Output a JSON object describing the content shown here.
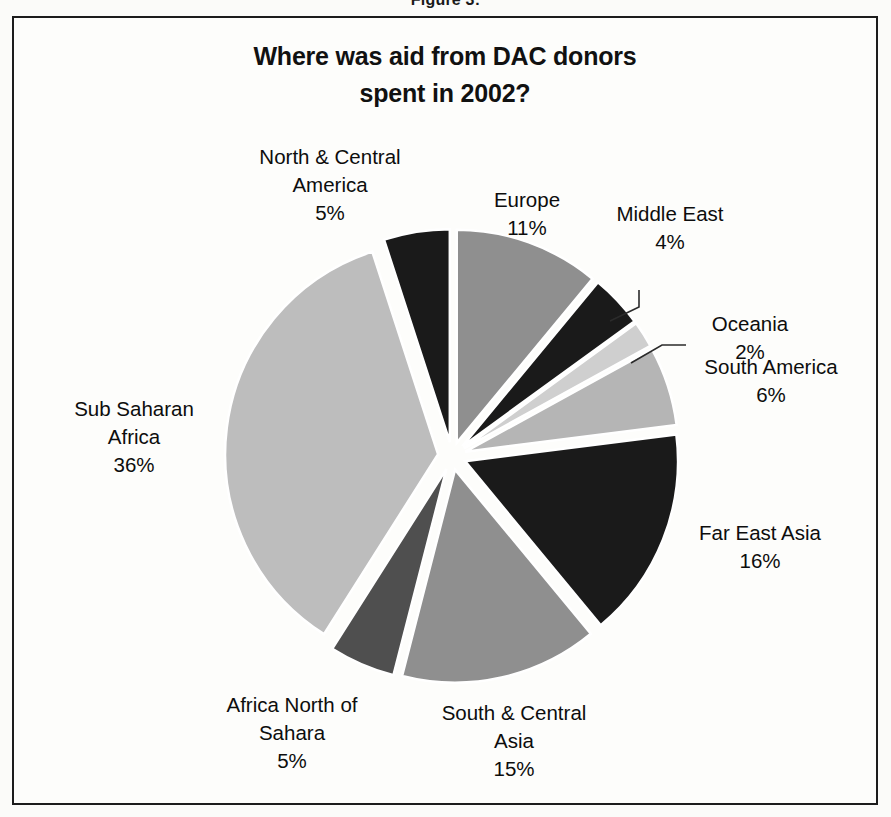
{
  "figure": {
    "caption": "Figure 3:"
  },
  "chart_title": {
    "line1": "Where was aid from DAC donors",
    "line2": "spent in 2002?"
  },
  "colors": {
    "background": "#fdfdfb",
    "frame_border": "#1c1c1c",
    "text": "#0d0d0d",
    "slice_black": "#1a1a1a",
    "slice_dark_gray": "#4f4f4f",
    "slice_mid_gray": "#8f8f8f",
    "slice_gray": "#9a9a9a",
    "slice_light_gray": "#bdbdbd",
    "slice_pale_gray": "#cfcfcf",
    "leader_line": "#2b2b2b"
  },
  "chart_data": {
    "type": "pie",
    "title": "Where was aid from DAC donors spent in 2002?",
    "unit": "%",
    "exploded": true,
    "legend_position": "none",
    "labels_show_percent": true,
    "categories": [
      "Europe",
      "Middle East",
      "Oceania",
      "South America",
      "Far East Asia",
      "South & Central Asia",
      "Africa North of Sahara",
      "Sub Saharan Africa",
      "North & Central America"
    ],
    "values": [
      11,
      4,
      2,
      6,
      16,
      15,
      5,
      36,
      5
    ],
    "slices": [
      {
        "name": "Europe",
        "value": 11,
        "value_text": "11%",
        "label_lines": [
          "Europe"
        ],
        "color": "#8f8f8f",
        "start_angle": 0,
        "end_angle": 39.6,
        "leader": false
      },
      {
        "name": "Middle East",
        "value": 4,
        "value_text": "4%",
        "label_lines": [
          "Middle East"
        ],
        "color": "#1a1a1a",
        "start_angle": 39.6,
        "end_angle": 54.0,
        "leader": true
      },
      {
        "name": "Oceania",
        "value": 2,
        "value_text": "2%",
        "label_lines": [
          "Oceania"
        ],
        "color": "#cfcfcf",
        "start_angle": 54.0,
        "end_angle": 61.2,
        "leader": true
      },
      {
        "name": "South America",
        "value": 6,
        "value_text": "6%",
        "label_lines": [
          "South America"
        ],
        "color": "#b5b5b5",
        "start_angle": 61.2,
        "end_angle": 82.8,
        "leader": false
      },
      {
        "name": "Far East Asia",
        "value": 16,
        "value_text": "16%",
        "label_lines": [
          "Far East Asia"
        ],
        "color": "#1a1a1a",
        "start_angle": 82.8,
        "end_angle": 140.4,
        "leader": false
      },
      {
        "name": "South & Central Asia",
        "value": 15,
        "value_text": "15%",
        "label_lines": [
          "South & Central",
          "Asia"
        ],
        "color": "#8f8f8f",
        "start_angle": 140.4,
        "end_angle": 194.4,
        "leader": false
      },
      {
        "name": "Africa North of Sahara",
        "value": 5,
        "value_text": "5%",
        "label_lines": [
          "Africa North of",
          "Sahara"
        ],
        "color": "#4f4f4f",
        "start_angle": 194.4,
        "end_angle": 212.4,
        "leader": false
      },
      {
        "name": "Sub Saharan Africa",
        "value": 36,
        "value_text": "36%",
        "label_lines": [
          "Sub Saharan",
          "Africa"
        ],
        "color": "#bdbdbd",
        "start_angle": 212.4,
        "end_angle": 342.0,
        "leader": false
      },
      {
        "name": "North & Central America",
        "value": 5,
        "value_text": "5%",
        "label_lines": [
          "North & Central",
          "America"
        ],
        "color": "#1a1a1a",
        "start_angle": 342.0,
        "end_angle": 360.0,
        "leader": false
      }
    ]
  },
  "labels": {
    "north_central_america": {
      "l1": "North & Central",
      "l2": "America",
      "pct": "5%"
    },
    "europe": {
      "l1": "Europe",
      "pct": "11%"
    },
    "middle_east": {
      "l1": "Middle East",
      "pct": "4%"
    },
    "oceania": {
      "l1": "Oceania",
      "pct": "2%"
    },
    "south_america": {
      "l1": "South America",
      "pct": "6%"
    },
    "far_east_asia": {
      "l1": "Far East Asia",
      "pct": "16%"
    },
    "south_central_asia": {
      "l1": "South & Central",
      "l2": "Asia",
      "pct": "15%"
    },
    "africa_north_sahara": {
      "l1": "Africa North of",
      "l2": "Sahara",
      "pct": "5%"
    },
    "sub_saharan_africa": {
      "l1": "Sub Saharan",
      "l2": "Africa",
      "pct": "36%"
    }
  }
}
